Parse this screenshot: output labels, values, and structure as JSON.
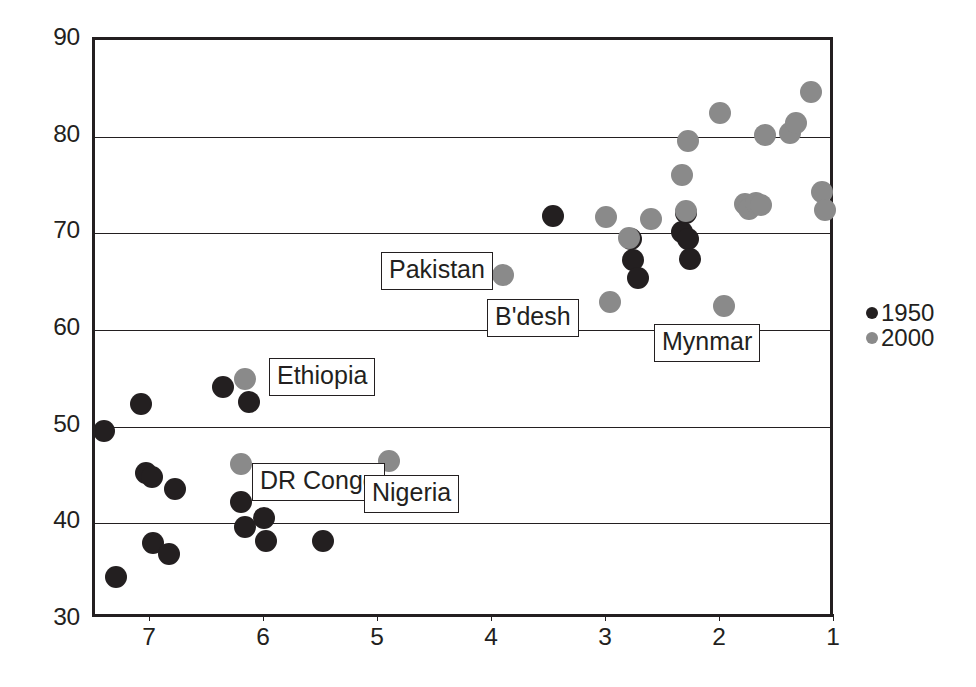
{
  "chart_data": {
    "type": "scatter",
    "title": "",
    "xlabel": "",
    "ylabel": "",
    "xlim": [
      7.5,
      1.0
    ],
    "ylim": [
      30,
      90
    ],
    "x_axis_reversed": true,
    "xticks": [
      7,
      6,
      5,
      4,
      3,
      2,
      1
    ],
    "yticks": [
      30,
      40,
      50,
      60,
      70,
      80,
      90
    ],
    "gridlines_y": [
      40,
      50,
      60,
      70,
      80
    ],
    "grid": true,
    "legend_position": "right",
    "colors": {
      "series_1950": "#231f20",
      "series_2000": "#8a8a8a",
      "axis": "#231f20",
      "background": "#ffffff"
    },
    "legend": [
      {
        "label": "1950",
        "color": "#231f20"
      },
      {
        "label": "2000",
        "color": "#8a8a8a"
      }
    ],
    "series": [
      {
        "name": "1950",
        "color": "#231f20",
        "points": [
          {
            "x": 7.42,
            "y": 49.6
          },
          {
            "x": 7.32,
            "y": 34.4
          },
          {
            "x": 7.1,
            "y": 52.3
          },
          {
            "x": 7.05,
            "y": 45.2
          },
          {
            "x": 7.0,
            "y": 44.8
          },
          {
            "x": 6.99,
            "y": 38.0
          },
          {
            "x": 6.85,
            "y": 36.8
          },
          {
            "x": 6.8,
            "y": 43.6
          },
          {
            "x": 6.38,
            "y": 54.1
          },
          {
            "x": 6.22,
            "y": 42.2
          },
          {
            "x": 6.18,
            "y": 39.6
          },
          {
            "x": 6.15,
            "y": 52.6
          },
          {
            "x": 6.02,
            "y": 40.6
          },
          {
            "x": 6.0,
            "y": 38.2
          },
          {
            "x": 5.5,
            "y": 38.2
          },
          {
            "x": 3.48,
            "y": 71.8
          },
          {
            "x": 2.8,
            "y": 69.4
          },
          {
            "x": 2.78,
            "y": 67.2
          },
          {
            "x": 2.74,
            "y": 65.4
          },
          {
            "x": 2.35,
            "y": 70.1
          },
          {
            "x": 2.32,
            "y": 72.1
          },
          {
            "x": 2.3,
            "y": 69.4
          },
          {
            "x": 2.28,
            "y": 67.3
          }
        ]
      },
      {
        "name": "2000",
        "color": "#8a8a8a",
        "points": [
          {
            "x": 6.18,
            "y": 54.9
          },
          {
            "x": 6.22,
            "y": 46.1
          },
          {
            "x": 4.92,
            "y": 46.4
          },
          {
            "x": 3.92,
            "y": 65.7
          },
          {
            "x": 3.02,
            "y": 71.7
          },
          {
            "x": 2.98,
            "y": 62.9
          },
          {
            "x": 2.82,
            "y": 69.5
          },
          {
            "x": 2.62,
            "y": 71.5
          },
          {
            "x": 2.35,
            "y": 76.0
          },
          {
            "x": 2.32,
            "y": 72.3
          },
          {
            "x": 2.3,
            "y": 79.6
          },
          {
            "x": 2.02,
            "y": 82.5
          },
          {
            "x": 1.98,
            "y": 62.5
          },
          {
            "x": 1.8,
            "y": 73.0
          },
          {
            "x": 1.76,
            "y": 72.5
          },
          {
            "x": 1.7,
            "y": 73.1
          },
          {
            "x": 1.66,
            "y": 72.9
          },
          {
            "x": 1.62,
            "y": 80.2
          },
          {
            "x": 1.4,
            "y": 80.4
          },
          {
            "x": 1.35,
            "y": 81.4
          },
          {
            "x": 1.22,
            "y": 84.6
          },
          {
            "x": 1.12,
            "y": 74.3
          },
          {
            "x": 1.1,
            "y": 72.4
          }
        ]
      }
    ],
    "annotations": [
      {
        "label": "Pakistan",
        "x_px": 381,
        "y_px": 252
      },
      {
        "label": "B'desh",
        "x_px": 487,
        "y_px": 299
      },
      {
        "label": "Mynmar",
        "x_px": 654,
        "y_px": 324
      },
      {
        "label": "Ethiopia",
        "x_px": 269,
        "y_px": 358
      },
      {
        "label": "DR Congo",
        "x_px": 252,
        "y_px": 463
      },
      {
        "label": "Nigeria",
        "x_px": 364,
        "y_px": 475
      }
    ]
  }
}
